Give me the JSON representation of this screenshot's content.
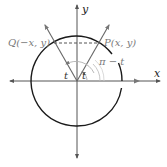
{
  "diagram": {
    "axes": {
      "x_label": "x",
      "y_label": "y"
    },
    "points": {
      "P": {
        "label": "P(x, y)"
      },
      "Q": {
        "label": "Q(−x, y)"
      }
    },
    "angles": {
      "left_angle": "t",
      "right_angle": "t",
      "supplement": "π − t"
    },
    "colors": {
      "axis": "#555555",
      "circle": "#1a1a1a",
      "ray": "#666666",
      "label_gray": "#7a7a7a",
      "arc_gray": "#b0b0b0",
      "dashed": "#555555"
    }
  }
}
